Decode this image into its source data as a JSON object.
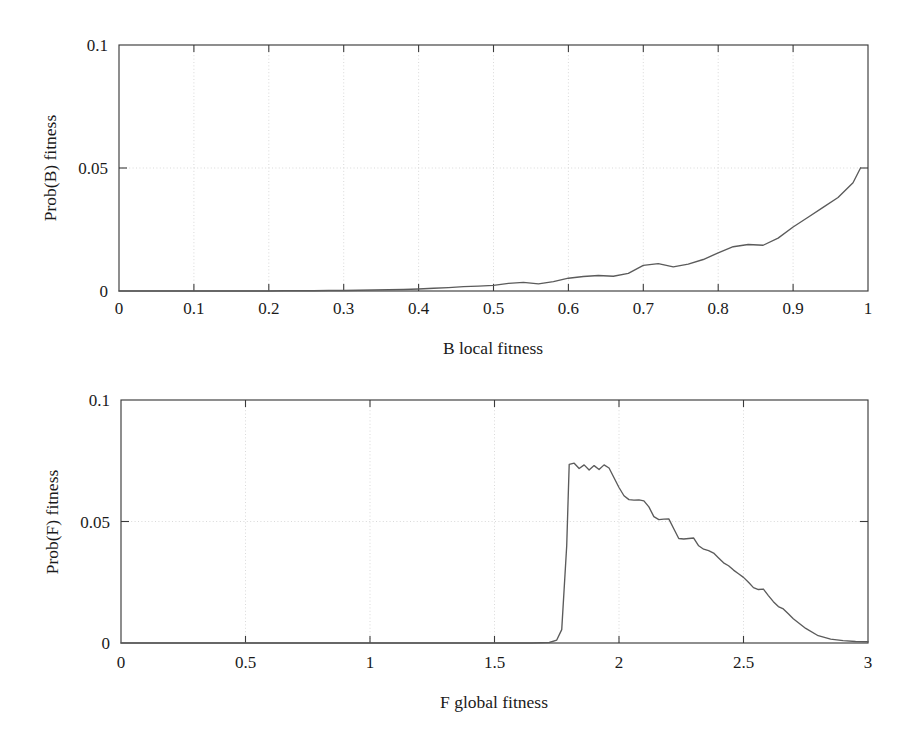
{
  "figure": {
    "background": "#ffffff",
    "line_color": "#5b5b5b",
    "axis_color": "#3b3b3b",
    "grid_color": "#c9c9c9"
  },
  "chart_data": [
    {
      "id": "prob-b-local-fitness",
      "type": "line",
      "title": "",
      "xlabel": "B local fitness",
      "ylabel": "Prob(B) fitness",
      "xlim": [
        0,
        1
      ],
      "ylim": [
        0,
        0.1
      ],
      "xticks": [
        0,
        0.1,
        0.2,
        0.3,
        0.4,
        0.5,
        0.6,
        0.7,
        0.8,
        0.9,
        1
      ],
      "xtick_labels": [
        "0",
        "0.1",
        "0.2",
        "0.3",
        "0.4",
        "0.5",
        "0.6",
        "0.7",
        "0.8",
        "0.9",
        "1"
      ],
      "yticks": [
        0,
        0.05,
        0.1
      ],
      "ytick_labels": [
        "0",
        "0.05",
        "0.1"
      ],
      "grid": true,
      "legend": "none",
      "x": [
        0.0,
        0.02,
        0.04,
        0.06,
        0.08,
        0.1,
        0.12,
        0.14,
        0.16,
        0.18,
        0.2,
        0.22,
        0.24,
        0.26,
        0.28,
        0.3,
        0.32,
        0.34,
        0.36,
        0.38,
        0.4,
        0.42,
        0.44,
        0.46,
        0.48,
        0.5,
        0.52,
        0.54,
        0.56,
        0.58,
        0.6,
        0.62,
        0.64,
        0.66,
        0.68,
        0.7,
        0.72,
        0.74,
        0.76,
        0.78,
        0.8,
        0.82,
        0.84,
        0.86,
        0.88,
        0.9,
        0.92,
        0.94,
        0.96,
        0.98,
        0.99
      ],
      "y": [
        0.0,
        0.0,
        0.0,
        0.0,
        0.0,
        0.0,
        0.0,
        0.0,
        0.0,
        0.0,
        0.0,
        0.0001,
        0.0001,
        0.0001,
        0.0002,
        0.0002,
        0.0003,
        0.0004,
        0.0005,
        0.0006,
        0.0008,
        0.0011,
        0.0014,
        0.0018,
        0.002,
        0.0023,
        0.0031,
        0.0035,
        0.0029,
        0.0038,
        0.0052,
        0.0059,
        0.0063,
        0.006,
        0.0072,
        0.0104,
        0.0111,
        0.0098,
        0.0109,
        0.0128,
        0.0155,
        0.018,
        0.0189,
        0.0186,
        0.0215,
        0.026,
        0.03,
        0.034,
        0.038,
        0.044,
        0.05
      ],
      "annotations": []
    },
    {
      "id": "prob-f-global-fitness",
      "type": "line",
      "title": "",
      "xlabel": "F global fitness",
      "ylabel": "Prob(F) fitness",
      "xlim": [
        0,
        3
      ],
      "ylim": [
        0,
        0.1
      ],
      "xticks": [
        0,
        0.5,
        1,
        1.5,
        2,
        2.5,
        3
      ],
      "xtick_labels": [
        "0",
        "0.5",
        "1",
        "1.5",
        "2",
        "2.5",
        "3"
      ],
      "yticks": [
        0,
        0.05,
        0.1
      ],
      "ytick_labels": [
        "0",
        "0.05",
        "0.1"
      ],
      "grid": true,
      "legend": "none",
      "x": [
        0.0,
        0.25,
        0.5,
        0.75,
        1.0,
        1.25,
        1.5,
        1.65,
        1.72,
        1.75,
        1.77,
        1.79,
        1.8,
        1.82,
        1.84,
        1.86,
        1.88,
        1.9,
        1.92,
        1.94,
        1.96,
        1.98,
        2.0,
        2.02,
        2.04,
        2.06,
        2.08,
        2.1,
        2.12,
        2.14,
        2.16,
        2.18,
        2.2,
        2.22,
        2.24,
        2.26,
        2.28,
        2.3,
        2.32,
        2.34,
        2.36,
        2.38,
        2.4,
        2.42,
        2.44,
        2.46,
        2.48,
        2.5,
        2.52,
        2.54,
        2.56,
        2.58,
        2.6,
        2.62,
        2.64,
        2.66,
        2.68,
        2.7,
        2.75,
        2.8,
        2.85,
        2.9,
        2.95,
        3.0
      ],
      "y": [
        0.0,
        0.0,
        0.0,
        0.0,
        0.0,
        0.0,
        0.0,
        0.0,
        0.0002,
        0.0012,
        0.0055,
        0.04,
        0.0735,
        0.074,
        0.0718,
        0.0733,
        0.0712,
        0.073,
        0.0714,
        0.0733,
        0.072,
        0.068,
        0.064,
        0.0606,
        0.059,
        0.0588,
        0.0589,
        0.0585,
        0.056,
        0.052,
        0.0508,
        0.051,
        0.0511,
        0.047,
        0.043,
        0.0428,
        0.043,
        0.0432,
        0.04,
        0.0386,
        0.038,
        0.037,
        0.035,
        0.033,
        0.0318,
        0.03,
        0.0285,
        0.027,
        0.025,
        0.0228,
        0.022,
        0.0222,
        0.0195,
        0.017,
        0.015,
        0.014,
        0.012,
        0.01,
        0.006,
        0.003,
        0.0016,
        0.001,
        0.0006,
        0.0005
      ],
      "annotations": []
    }
  ]
}
